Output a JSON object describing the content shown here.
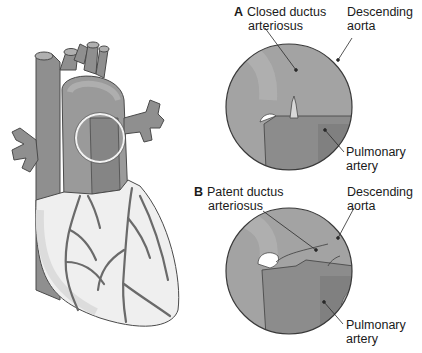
{
  "figure": {
    "heart": {
      "name": "Heart with great vessels"
    },
    "panel_a": {
      "letter": "A",
      "title_line1": "Closed ductus",
      "title_line2": "arteriosus",
      "labels": {
        "descending_aorta_line1": "Descending",
        "descending_aorta_line2": "aorta",
        "pulmonary_artery_line1": "Pulmonary",
        "pulmonary_artery_line2": "artery"
      }
    },
    "panel_b": {
      "letter": "B",
      "title_line1": "Patent ductus",
      "title_line2": "arteriosus",
      "labels": {
        "descending_aorta_line1": "Descending",
        "descending_aorta_line2": "aorta",
        "pulmonary_artery_line1": "Pulmonary",
        "pulmonary_artery_line2": "artery"
      }
    },
    "colors": {
      "vessel": "#8f8f8f",
      "vessel_light": "#a8a8a8",
      "heart_body": "#efefef",
      "outline": "#4a4a4a",
      "circle_bg": "#a0a0a0",
      "pulmonary": "#8c8c8c"
    }
  }
}
